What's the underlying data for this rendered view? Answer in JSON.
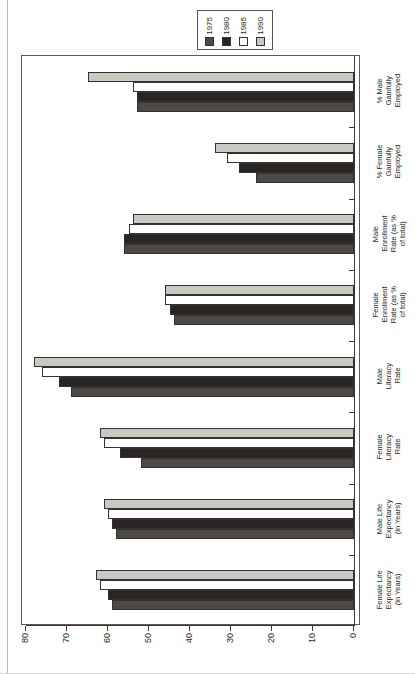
{
  "chart_data": {
    "type": "bar",
    "orientation": "horizontal-rotated",
    "title": "",
    "xlabel": "",
    "ylabel": "",
    "axis_range": [
      0,
      80
    ],
    "axis_ticks": [
      80,
      70,
      60,
      50,
      40,
      30,
      20,
      10,
      0
    ],
    "axis_direction": "right-to-left",
    "grid": false,
    "legend_position": "top",
    "categories": [
      "% Male Gainfully Employed",
      "% Female Gainfully Employed",
      "Male Enrollment Rate (as % of total)",
      "Female Enrollment Rate (as % of total)",
      "Male Literacy Rate",
      "Female Literacy Rate",
      "Male Life Expectancy (in Years)",
      "Female Life Expectancy (in Years)"
    ],
    "category_lines": [
      [
        "% Male",
        "Gainfully",
        "Employed"
      ],
      [
        "% Female",
        "Gainfully",
        "Employed"
      ],
      [
        "Male",
        "Enrollment",
        "Rate (as %",
        "of total)"
      ],
      [
        "Female",
        "Enrollment",
        "Rate (as %",
        "of total)"
      ],
      [
        "Male",
        "Literacy",
        "Rate"
      ],
      [
        "Female",
        "Literacy",
        "Rate"
      ],
      [
        "Male Life",
        "Expectancy",
        "(in Years)"
      ],
      [
        "Female Life",
        "Expectancy",
        "(in Years)"
      ]
    ],
    "series": [
      {
        "name": "1990",
        "color": "#c9c9c4",
        "values": [
          65,
          34,
          54,
          46,
          78,
          62,
          61,
          63
        ]
      },
      {
        "name": "1985",
        "color": "#ffffff",
        "values": [
          54,
          31,
          55,
          46,
          76,
          61,
          60,
          62
        ]
      },
      {
        "name": "1980",
        "color": "#282524",
        "values": [
          53,
          28,
          56,
          45,
          72,
          57,
          59,
          60
        ]
      },
      {
        "name": "1975",
        "color": "#4c4947",
        "values": [
          53,
          24,
          56,
          44,
          69,
          52,
          58,
          59
        ]
      }
    ]
  },
  "legend": {
    "items": [
      {
        "label": "1975",
        "color": "#4c4947"
      },
      {
        "label": "1980",
        "color": "#282524"
      },
      {
        "label": "1985",
        "color": "#ffffff"
      },
      {
        "label": "1990",
        "color": "#c9c9c4"
      }
    ]
  },
  "axis": {
    "ticks": [
      "80",
      "70",
      "60",
      "50",
      "40",
      "30",
      "20",
      "10",
      "0"
    ]
  }
}
